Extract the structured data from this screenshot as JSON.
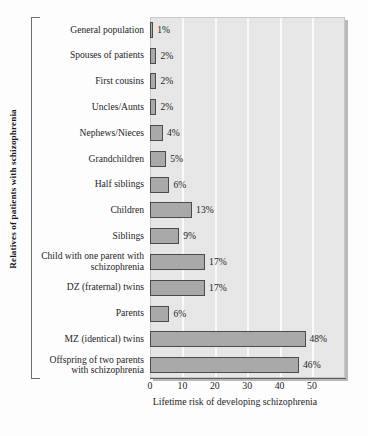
{
  "chart_data": {
    "type": "bar",
    "orientation": "horizontal",
    "title": "",
    "xlabel": "Lifetime risk of developing schizophrenia",
    "ylabel": "Relatives of patients with schizophrenia",
    "xlim": [
      0,
      60
    ],
    "xticks": [
      0,
      10,
      20,
      30,
      40,
      50
    ],
    "xtick_labels": [
      "0",
      "10",
      "20",
      "30",
      "40",
      "50"
    ],
    "grid": "vertical-white-bands",
    "legend": "none",
    "categories": [
      "General population",
      "Spouses of patients",
      "First cousins",
      "Uncles/Aunts",
      "Nephews/Nieces",
      "Grandchildren",
      "Half siblings",
      "Children",
      "Siblings",
      "Child with one parent with schizophrenia",
      "DZ (fraternal) twins",
      "Parents",
      "MZ (identical) twins",
      "Offspring of two parents with schizophrenia"
    ],
    "values": [
      1,
      2,
      2,
      2,
      4,
      5,
      6,
      13,
      9,
      17,
      17,
      6,
      48,
      46
    ],
    "value_labels": [
      "1%",
      "2%",
      "2%",
      "2%",
      "4%",
      "5%",
      "6%",
      "13%",
      "9%",
      "17%",
      "17%",
      "6%",
      "48%",
      "46%"
    ],
    "bar_color": "#a9a9a9",
    "bar_edge_color": "#4b4b4b",
    "plot_background": "#e6e6e6",
    "gridline_color": "#fafafa"
  }
}
